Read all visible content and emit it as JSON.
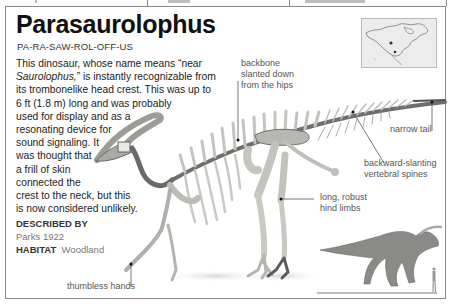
{
  "page": {
    "title": "Parasaurolophus",
    "pronunciation": "PA-RA-SAW-ROL-OFF-US",
    "description_lines": [
      [
        "This dinosaur, whose name means “near",
        ""
      ],
      [
        "Saurolophus,",
        "” is instantly recognizable from"
      ],
      [
        "its trombonelike head crest. This was up to",
        ""
      ],
      [
        "6 ft (1.8 m) long and was probably",
        ""
      ],
      [
        "used for display and as a",
        ""
      ],
      [
        "resonating device for",
        ""
      ],
      [
        "sound signaling. It",
        ""
      ],
      [
        "was thought that",
        ""
      ],
      [
        "a frill of skin",
        ""
      ],
      [
        "connected the",
        ""
      ],
      [
        "crest to the neck, but this",
        ""
      ],
      [
        "is now considered unlikely.",
        ""
      ]
    ],
    "described_by_label": "DESCRIBED BY",
    "described_by_value": "Parks 1922",
    "habitat_label": "HABITAT",
    "habitat_value": "Woodland"
  },
  "annotations": {
    "backbone": [
      "backbone",
      "slanted down",
      "from the hips"
    ],
    "narrow_tail": "narrow tail",
    "vertebral_spines": [
      "backward-slanting",
      "vertebral spines"
    ],
    "hind_limbs": [
      "long, robust",
      "hind limbs"
    ],
    "hands": "thumbless hands"
  },
  "figures": {
    "map": "north-america-range-map",
    "skeleton": "parasaurolophus-skeleton",
    "reconstruction": "parasaurolophus-life-reconstruction",
    "scale_human": "human-scale-silhouette"
  },
  "colors": {
    "border": "#8a8a8a",
    "bone": "#c9c9c4",
    "bone_dark": "#5a5a58",
    "text": "#1a1a1a",
    "annotation": "#555555"
  }
}
